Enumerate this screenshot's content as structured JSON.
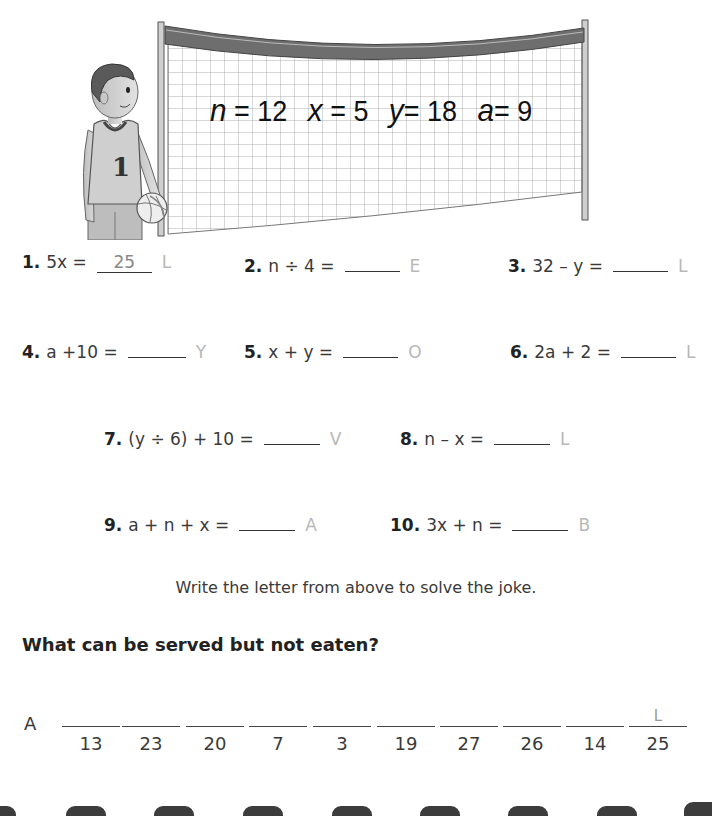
{
  "illustration": {
    "description": "boy in jersey number 1 holding a volleyball beside a volleyball net",
    "jersey_number": "1",
    "net_values": [
      {
        "var": "n",
        "value": "12"
      },
      {
        "var": "x",
        "value": "5"
      },
      {
        "var": "y",
        "value": "18"
      },
      {
        "var": "a",
        "value": "9"
      }
    ]
  },
  "problems": [
    {
      "num": "1.",
      "expr": "5x =",
      "answer": "25",
      "letter": "L"
    },
    {
      "num": "2.",
      "expr": "n ÷ 4 =",
      "answer": "",
      "letter": "E"
    },
    {
      "num": "3.",
      "expr": "32 – y =",
      "answer": "",
      "letter": "L"
    },
    {
      "num": "4.",
      "expr": "a +10 =",
      "answer": "",
      "letter": "Y"
    },
    {
      "num": "5.",
      "expr": "x + y =",
      "answer": "",
      "letter": "O"
    },
    {
      "num": "6.",
      "expr": "2a + 2 =",
      "answer": "",
      "letter": "L"
    },
    {
      "num": "7.",
      "expr": "(y ÷ 6) + 10 =",
      "answer": "",
      "letter": "V"
    },
    {
      "num": "8.",
      "expr": "n  –  x =",
      "answer": "",
      "letter": "L"
    },
    {
      "num": "9.",
      "expr": "a + n + x =",
      "answer": "",
      "letter": "A"
    },
    {
      "num": "10.",
      "expr": "3x + n =",
      "answer": "",
      "letter": "B"
    }
  ],
  "instruction": "Write the letter from above to solve the joke.",
  "question": "What can be served but not eaten?",
  "answer": {
    "prefix": "A",
    "slots": [
      {
        "code": "13",
        "letter": ""
      },
      {
        "code": "23",
        "letter": ""
      },
      {
        "code": "20",
        "letter": ""
      },
      {
        "code": "7",
        "letter": ""
      },
      {
        "code": "3",
        "letter": ""
      },
      {
        "code": "19",
        "letter": ""
      },
      {
        "code": "27",
        "letter": ""
      },
      {
        "code": "26",
        "letter": ""
      },
      {
        "code": "14",
        "letter": ""
      },
      {
        "code": "25",
        "letter": "L"
      }
    ]
  }
}
